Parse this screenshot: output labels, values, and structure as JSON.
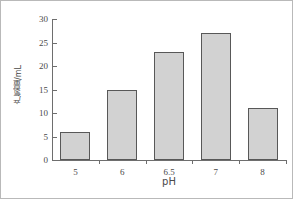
{
  "chart_data": {
    "type": "bar",
    "title": "",
    "xlabel": "pH",
    "ylabel": "产氢量/mL",
    "categories": [
      "5",
      "6",
      "6.5",
      "7",
      "8"
    ],
    "values": [
      6,
      15,
      23,
      27,
      11
    ],
    "ylim": [
      0,
      30
    ],
    "yticks": [
      0,
      5,
      10,
      15,
      20,
      25,
      30
    ],
    "ytick_labels": [
      "0",
      "5",
      "10",
      "15",
      "20",
      "25",
      "30"
    ],
    "grid": false,
    "legend": null,
    "series": [
      {
        "name": "产氢量",
        "values": [
          6,
          15,
          23,
          27,
          11
        ]
      }
    ],
    "bar_fill_color": "#d2d2d2",
    "bar_edge_color": "#585858",
    "axis_color": "#6e6e6e",
    "frame_color": "#b9b9b9",
    "text_color": "#4a4a4a"
  }
}
